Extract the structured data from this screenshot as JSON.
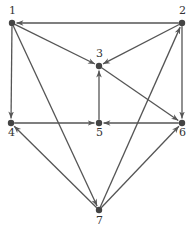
{
  "diagram": {
    "type": "directed-graph",
    "colors": {
      "edge": "#555555",
      "node": "#444444",
      "label": "#333333",
      "background": "#ffffff"
    },
    "nodes": [
      {
        "id": "1",
        "label": "1",
        "x": 12,
        "y": 23,
        "lx": 9,
        "ly": 14
      },
      {
        "id": "2",
        "label": "2",
        "x": 182,
        "y": 23,
        "lx": 179,
        "ly": 14
      },
      {
        "id": "3",
        "label": "3",
        "x": 99,
        "y": 66,
        "lx": 96,
        "ly": 57
      },
      {
        "id": "4",
        "label": "4",
        "x": 11,
        "y": 123,
        "lx": 8,
        "ly": 136
      },
      {
        "id": "5",
        "label": "5",
        "x": 99,
        "y": 123,
        "lx": 96,
        "ly": 136
      },
      {
        "id": "6",
        "label": "6",
        "x": 182,
        "y": 123,
        "lx": 179,
        "ly": 136
      },
      {
        "id": "7",
        "label": "7",
        "x": 99,
        "y": 210,
        "lx": 96,
        "ly": 224
      }
    ],
    "edges": [
      {
        "from": "2",
        "to": "1"
      },
      {
        "from": "1",
        "to": "3"
      },
      {
        "from": "1",
        "to": "4"
      },
      {
        "from": "1",
        "to": "7"
      },
      {
        "from": "2",
        "to": "3"
      },
      {
        "from": "2",
        "to": "6"
      },
      {
        "from": "3",
        "to": "6"
      },
      {
        "from": "5",
        "to": "3"
      },
      {
        "from": "4",
        "to": "5"
      },
      {
        "from": "6",
        "to": "5"
      },
      {
        "from": "7",
        "to": "4"
      },
      {
        "from": "7",
        "to": "2"
      },
      {
        "from": "7",
        "to": "6"
      }
    ]
  }
}
